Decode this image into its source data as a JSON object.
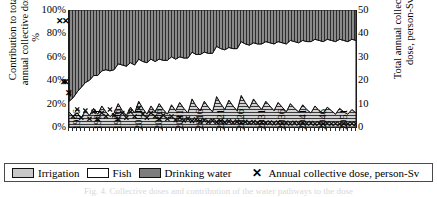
{
  "axes": {
    "left_title": "Contribution to total\nannual collective dose,\n%",
    "right_title": "Total annual collective\ndose, person-Sv",
    "left_ticks": [
      "100%",
      "80%",
      "60%",
      "40%",
      "20%",
      "0%"
    ],
    "right_ticks": [
      "50",
      "40",
      "30",
      "20",
      "10",
      "0"
    ],
    "x_ticks": [
      "1986",
      "1991",
      "1996",
      "2001",
      "2006",
      "2011",
      "2016",
      "2021",
      "2026",
      "2031",
      "2036",
      "2041",
      "2046",
      "2051"
    ]
  },
  "legend": {
    "irrigation": "Irrigation",
    "fish": "Fish",
    "drinking_water": "Drinking water",
    "marker_glyph": "✕",
    "dose_series": "Annual collective dose, person-Sv"
  },
  "colors": {
    "irrigation": "#c8c8c8",
    "fish": "#ffffff",
    "drinking_water": "#7d7d7d",
    "marker": "#111111",
    "axis": "#1a1a1a"
  },
  "caption": "Fig. 4. Collective doses and contribution of the water pathways to the dose",
  "chart_data": {
    "type": "area",
    "title": "",
    "xlabel": "",
    "ylabel": "Contribution to total annual collective dose, %",
    "ylabel_right": "Total annual collective dose, person-Sv",
    "ylim": [
      0,
      100
    ],
    "ylim_right": [
      0,
      50
    ],
    "xlim": [
      1986,
      2056
    ],
    "grid": false,
    "legend_position": "bottom",
    "stacked": true,
    "x": [
      1986,
      1987,
      1988,
      1989,
      1990,
      1991,
      1992,
      1993,
      1994,
      1995,
      1996,
      1997,
      1998,
      1999,
      2000,
      2001,
      2002,
      2003,
      2004,
      2005,
      2006,
      2007,
      2008,
      2009,
      2010,
      2011,
      2012,
      2013,
      2014,
      2015,
      2016,
      2017,
      2018,
      2019,
      2020,
      2021,
      2022,
      2023,
      2024,
      2025,
      2026,
      2027,
      2028,
      2029,
      2030,
      2031,
      2032,
      2033,
      2034,
      2035,
      2036,
      2037,
      2038,
      2039,
      2040,
      2041,
      2042,
      2043,
      2044,
      2045,
      2046,
      2047,
      2048,
      2049,
      2050,
      2051,
      2052,
      2053,
      2054,
      2055,
      2056
    ],
    "series": [
      {
        "name": "Irrigation",
        "pattern": "horizontal-lines",
        "color": "#c8c8c8",
        "values": [
          13,
          9,
          12,
          8,
          14,
          10,
          16,
          11,
          18,
          13,
          9,
          12,
          20,
          14,
          10,
          17,
          12,
          22,
          16,
          11,
          18,
          13,
          20,
          15,
          11,
          19,
          14,
          21,
          16,
          12,
          24,
          18,
          14,
          22,
          17,
          13,
          26,
          20,
          15,
          23,
          18,
          14,
          27,
          21,
          16,
          24,
          19,
          15,
          22,
          18,
          14,
          21,
          17,
          13,
          20,
          16,
          13,
          19,
          15,
          12,
          18,
          14,
          12,
          17,
          14,
          11,
          16,
          13,
          11,
          15,
          12
        ]
      },
      {
        "name": "Fish",
        "pattern": "solid-white",
        "color": "#ffffff",
        "values": [
          9,
          16,
          18,
          26,
          24,
          30,
          28,
          33,
          30,
          36,
          39,
          37,
          34,
          39,
          42,
          38,
          41,
          36,
          40,
          44,
          40,
          43,
          38,
          42,
          46,
          41,
          44,
          39,
          43,
          47,
          40,
          44,
          48,
          42,
          46,
          50,
          43,
          47,
          51,
          45,
          49,
          53,
          46,
          50,
          54,
          48,
          52,
          56,
          51,
          54,
          57,
          52,
          55,
          58,
          54,
          57,
          59,
          55,
          58,
          61,
          57,
          60,
          61,
          58,
          60,
          62,
          59,
          61,
          62,
          60,
          62
        ]
      },
      {
        "name": "Drinking water",
        "pattern": "vertical-lines",
        "color": "#7d7d7d",
        "values": [
          78,
          75,
          70,
          66,
          62,
          60,
          56,
          56,
          52,
          51,
          52,
          51,
          46,
          47,
          48,
          45,
          47,
          42,
          44,
          45,
          42,
          44,
          42,
          43,
          43,
          40,
          42,
          40,
          41,
          41,
          36,
          38,
          38,
          36,
          37,
          37,
          31,
          33,
          34,
          32,
          33,
          33,
          27,
          29,
          30,
          28,
          29,
          29,
          27,
          28,
          29,
          27,
          28,
          29,
          26,
          27,
          28,
          26,
          27,
          27,
          25,
          26,
          27,
          25,
          26,
          27,
          25,
          26,
          27,
          25,
          26
        ]
      }
    ],
    "marker_series": {
      "name": "Annual collective dose, person-Sv",
      "marker": "x",
      "axis": "right",
      "x": [
        1984,
        1985,
        1986,
        1987,
        1988,
        1989,
        1990,
        1991,
        1992,
        1993,
        1994,
        1995,
        1996,
        1997,
        1998,
        1999,
        2000,
        2001,
        2002,
        2003,
        2004,
        2005,
        2006,
        2007,
        2008,
        2009,
        2010,
        2011,
        2012,
        2013,
        2014,
        2015,
        2016,
        2017,
        2018,
        2019,
        2020,
        2021,
        2022,
        2023,
        2024,
        2025,
        2026,
        2027,
        2028,
        2029,
        2030,
        2031,
        2032,
        2033,
        2034,
        2035,
        2036,
        2037,
        2038,
        2039,
        2040,
        2041,
        2042,
        2043,
        2044,
        2045,
        2046,
        2047,
        2048,
        2049,
        2050,
        2051,
        2052,
        2053,
        2054,
        2055,
        2056
      ],
      "values": [
        45,
        19,
        14,
        4.5,
        7.5,
        4,
        7,
        3.5,
        6.5,
        3.5,
        6,
        4.5,
        7.5,
        5,
        3.5,
        6,
        4,
        6.5,
        4.5,
        8,
        5.5,
        4,
        6,
        4.5,
        3.5,
        5,
        3.5,
        4.5,
        3,
        4,
        2.8,
        3.6,
        2.6,
        3.2,
        2.4,
        2.9,
        2.2,
        2.7,
        2.1,
        2.5,
        2,
        2.4,
        1.9,
        2.3,
        1.8,
        2.2,
        1.8,
        2.1,
        1.7,
        2,
        1.7,
        1.9,
        1.6,
        1.9,
        1.6,
        1.8,
        1.5,
        1.8,
        1.5,
        1.7,
        1.5,
        1.7,
        1.4,
        1.6,
        1.4,
        1.6,
        1.4,
        1.5,
        1.3,
        1.5,
        1.3,
        1.5,
        1.3
      ]
    }
  }
}
